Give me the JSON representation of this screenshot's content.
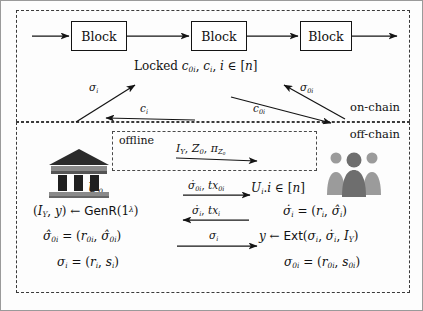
{
  "diagram": {
    "panels": {
      "onchain_label": "on-chain",
      "offchain_label": "off-chain",
      "offline_label": "offline"
    },
    "blockchain": {
      "blocks": [
        {
          "label": "Block"
        },
        {
          "label": "Block"
        },
        {
          "label": "Block"
        }
      ],
      "locked_text": "Locked c0i, ci, i ∈ [n]"
    },
    "chain_arrow_labels": {
      "up_left": "σi",
      "down_left": "ci",
      "up_right": "σ0i",
      "down_right": "c0i"
    },
    "actors": {
      "left": {
        "icon": "bank-icon",
        "label": "U0"
      },
      "right": {
        "icon": "people-group-icon",
        "label": "Ui.i ∈ [n]"
      }
    },
    "message_arrows": [
      {
        "label": "IY , Z0, πZ0",
        "direction": "right"
      },
      {
        "label": "σ̇0i, tx0i",
        "direction": "right"
      },
      {
        "label": "σ̇i, txi",
        "direction": "left"
      },
      {
        "label": "σi",
        "direction": "right"
      }
    ],
    "left_equations": [
      "(IY , y) ← GenR(1λ)",
      "σ̂0i = (r0i, σ̂0i)",
      "σi = (ri, si)"
    ],
    "right_equations": [
      "σ̇i = (ri, σ̂i)",
      "y ← Ext(σi, σ̇i, IY )",
      "σ0i = (r0i, s0i)"
    ],
    "colors": {
      "stroke": "#141414",
      "dashed_border": "#3a3a3a",
      "background": "#fdfdfd"
    }
  }
}
